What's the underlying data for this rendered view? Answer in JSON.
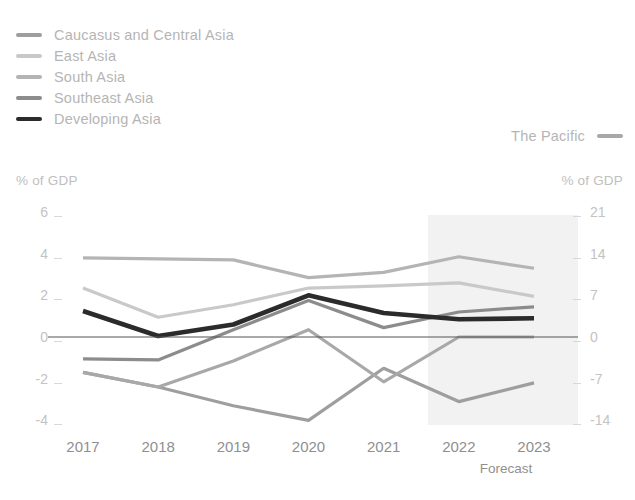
{
  "legend": {
    "left_items": [
      {
        "label": "Caucasus and Central Asia",
        "color": "#9e9e9e"
      },
      {
        "label": "East Asia",
        "color": "#c9c9c9"
      },
      {
        "label": "South Asia",
        "color": "#b4b4b4"
      },
      {
        "label": "Southeast Asia",
        "color": "#8c8c8c"
      },
      {
        "label": "Developing Asia",
        "color": "#2b2b2b"
      }
    ],
    "right_items": [
      {
        "label": "The Pacific",
        "color": "#a8a8a8"
      }
    ]
  },
  "axes": {
    "left_title": "% of GDP",
    "right_title": "% of GDP",
    "left_ticks": [
      "6",
      "4",
      "2",
      "0",
      "-2",
      "-4"
    ],
    "right_ticks": [
      "21",
      "14",
      "7",
      "0",
      "-7",
      "-14"
    ],
    "x_ticks": [
      "2017",
      "2018",
      "2019",
      "2020",
      "2021",
      "2022",
      "2023"
    ],
    "forecast_label": "Forecast"
  },
  "chart_data": {
    "type": "line",
    "title": "",
    "xlabel": "",
    "ylabel": "% of GDP",
    "x": [
      "2017",
      "2018",
      "2019",
      "2020",
      "2021",
      "2022",
      "2023"
    ],
    "ylim": [
      -5,
      6
    ],
    "left_axis": {
      "label": "% of GDP",
      "ticks": [
        6,
        4,
        2,
        0,
        -2,
        -4
      ],
      "range": [
        -5,
        6
      ]
    },
    "right_axis": {
      "label": "% of GDP",
      "ticks": [
        21,
        14,
        7,
        0,
        -7,
        -14
      ],
      "range": [
        -17.5,
        21
      ]
    },
    "grid": false,
    "legend_position": "top-left",
    "forecast_from": "2021.5",
    "forecast_note": "Forecast",
    "series": [
      {
        "name": "Caucasus and Central Asia",
        "color": "#9e9e9e",
        "width": 3.2,
        "values": [
          -1.7,
          -2.4,
          -3.3,
          -4.0,
          -1.5,
          -3.1,
          -2.2
        ]
      },
      {
        "name": "East Asia",
        "color": "#c9c9c9",
        "width": 3.2,
        "values": [
          2.35,
          0.95,
          1.55,
          2.35,
          2.45,
          2.6,
          1.95
        ]
      },
      {
        "name": "South Asia",
        "color": "#b4b4b4",
        "width": 3.2,
        "values": [
          3.8,
          3.75,
          3.7,
          2.85,
          3.1,
          3.85,
          3.3
        ]
      },
      {
        "name": "Southeast Asia",
        "color": "#8c8c8c",
        "width": 3.2,
        "values": [
          -1.05,
          -1.1,
          0.35,
          1.75,
          0.45,
          1.2,
          1.45
        ]
      },
      {
        "name": "Developing Asia",
        "color": "#2b2b2b",
        "width": 4.6,
        "values": [
          1.25,
          0.05,
          0.6,
          2.0,
          1.15,
          0.85,
          0.9
        ]
      },
      {
        "name": "The Pacific",
        "color": "#a8a8a8",
        "width": 3.2,
        "values": [
          -1.7,
          -2.4,
          -1.15,
          0.35,
          -2.15,
          0.0,
          0.0
        ]
      }
    ]
  },
  "geometry": {
    "plot_left": 83,
    "plot_right": 534,
    "y_zero": 337,
    "units_per_px": 0.048,
    "forecast_band": {
      "left": 428,
      "right": 578,
      "top": 215,
      "bottom": 425
    }
  }
}
